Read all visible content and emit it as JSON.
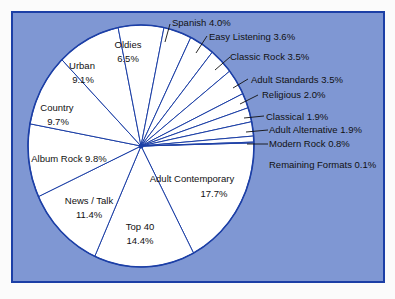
{
  "chart_data": {
    "type": "pie",
    "title": "",
    "colors": {
      "background": "#7f97d3",
      "border": "#1c3fa6",
      "slice_fill": "#ffffff",
      "slice_stroke": "#1c3fa6"
    },
    "slices": [
      {
        "label": "Adult Contemporary",
        "value": 17.7
      },
      {
        "label": "Top 40",
        "value": 14.4
      },
      {
        "label": "News / Talk",
        "value": 11.4
      },
      {
        "label": "Album Rock",
        "value": 9.8
      },
      {
        "label": "Country",
        "value": 9.7
      },
      {
        "label": "Urban",
        "value": 9.1
      },
      {
        "label": "Oldies",
        "value": 6.5
      },
      {
        "label": "Spanish",
        "value": 4.0
      },
      {
        "label": "Easy Listening",
        "value": 3.6
      },
      {
        "label": "Classic Rock",
        "value": 3.5
      },
      {
        "label": "Adult Standards",
        "value": 3.5
      },
      {
        "label": "Religious",
        "value": 2.0
      },
      {
        "label": "Classical",
        "value": 1.9
      },
      {
        "label": "Adult Alternative",
        "value": 1.9
      },
      {
        "label": "Modern Rock",
        "value": 0.8
      },
      {
        "label": "Remaining Formats",
        "value": 0.1
      }
    ]
  },
  "labels": {
    "adult_contemporary": [
      "Adult Contemporary",
      "17.7%"
    ],
    "top40": [
      "Top 40",
      "14.4%"
    ],
    "news_talk": [
      "News / Talk",
      "11.4%"
    ],
    "album_rock": "Album Rock 9.8%",
    "country": [
      "Country",
      "9.7%"
    ],
    "urban": [
      "Urban",
      "9.1%"
    ],
    "oldies": [
      "Oldies",
      "6.5%"
    ],
    "spanish": "Spanish  4.0%",
    "easy_listening": "Easy Listening 3.6%",
    "classic_rock": "Classic Rock 3.5%",
    "adult_standards": "Adult Standards 3.5%",
    "religious": "Religious 2.0%",
    "classical": "Classical 1.9%",
    "adult_alternative": "Adult Alternative 1.9%",
    "modern_rock": "Modern Rock 0.8%",
    "remaining": "Remaining Formats 0.1%"
  }
}
